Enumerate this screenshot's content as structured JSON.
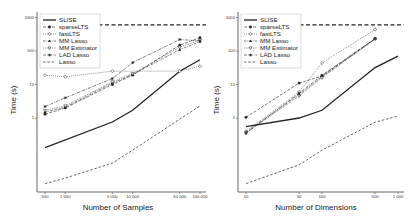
{
  "chart_data": [
    {
      "type": "line",
      "title": "",
      "xlabel": "Number of Samples",
      "ylabel": "Time (s)",
      "xscale": "log",
      "yscale": "log",
      "x": [
        500,
        1000,
        5000,
        10000,
        50000,
        100000
      ],
      "xticks": [
        500,
        1000,
        5000,
        10000,
        50000,
        100000
      ],
      "xtick_labels": [
        "500",
        "1 000",
        "5 000",
        "10 000",
        "50 000",
        "100 000"
      ],
      "yticks": [
        1,
        10,
        100,
        1000
      ],
      "ytick_labels": [
        "1",
        "10",
        "100",
        "1000"
      ],
      "ylim": [
        0.006,
        1000
      ],
      "timeout_line": 600,
      "legend_position": "upper-left",
      "grid": false,
      "series": [
        {
          "name": "SLISE",
          "values": [
            0.13,
            null,
            0.76,
            1.7,
            25,
            55
          ]
        },
        {
          "name": "sparseLTS",
          "values": [
            1.3,
            2.0,
            10,
            19,
            150,
            250
          ]
        },
        {
          "name": "fastLTS",
          "values": [
            19,
            17,
            25,
            null,
            25,
            35
          ]
        },
        {
          "name": "MM Lasso",
          "values": [
            1.5,
            2.1,
            11,
            20,
            110,
            190
          ]
        },
        {
          "name": "MM Estimator",
          "values": [
            1.7,
            2.3,
            12,
            21,
            130,
            210
          ]
        },
        {
          "name": "LAD Lasso",
          "values": [
            2.2,
            4.0,
            15,
            45,
            220,
            200
          ]
        },
        {
          "name": "Lasso",
          "values": [
            0.011,
            0.016,
            0.045,
            0.11,
            null,
            2.3
          ]
        }
      ]
    },
    {
      "type": "line",
      "title": "",
      "xlabel": "Number of Dimensions",
      "ylabel": "Time (s)",
      "xscale": "log",
      "yscale": "log",
      "x": [
        10,
        50,
        100,
        500,
        1000
      ],
      "xticks": [
        10,
        50,
        100,
        500,
        1000
      ],
      "xtick_labels": [
        "10",
        "50",
        "100",
        "500",
        "1 000"
      ],
      "yticks": [
        1,
        10,
        100,
        1000
      ],
      "ytick_labels": [
        "1",
        "10",
        "100",
        "1000"
      ],
      "ylim": [
        0.006,
        1000
      ],
      "timeout_line": 600,
      "legend_position": "upper-left",
      "grid": false,
      "series": [
        {
          "name": "SLISE",
          "values": [
            0.55,
            1.0,
            1.7,
            32,
            70
          ]
        },
        {
          "name": "sparseLTS",
          "values": [
            1.05,
            11,
            18,
            235,
            null
          ]
        },
        {
          "name": "fastLTS",
          "values": [
            0.4,
            6,
            44,
            440,
            null
          ]
        },
        {
          "name": "MM Lasso",
          "values": [
            0.38,
            5,
            17,
            230,
            null
          ]
        },
        {
          "name": "MM Estimator",
          "values": [
            0.36,
            4.5,
            16,
            225,
            null
          ]
        },
        {
          "name": "LAD Lasso",
          "values": [
            0.35,
            5.5,
            19,
            235,
            null
          ]
        },
        {
          "name": "Lasso",
          "values": [
            0.011,
            0.04,
            0.11,
            0.75,
            1.15
          ]
        }
      ]
    }
  ],
  "legend": {
    "items": [
      "SLISE",
      "sparseLTS",
      "fastLTS",
      "MM Lasso",
      "MM Estimator",
      "LAD Lasso",
      "Lasso"
    ]
  },
  "panels": [
    {
      "xlabel": "Number of Samples",
      "ylabel": "Time (s)"
    },
    {
      "xlabel": "Number of Dimensions",
      "ylabel": "Time (s)"
    }
  ]
}
